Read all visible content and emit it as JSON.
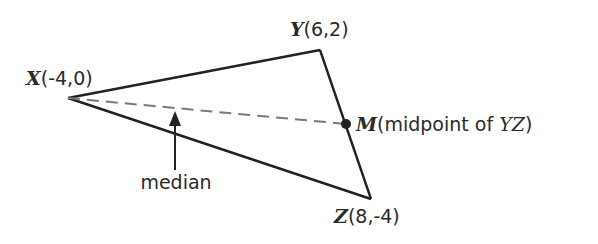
{
  "diagram": {
    "points": {
      "X": {
        "name": "X",
        "coords": "(-4,0)",
        "px": [
          68,
          98
        ]
      },
      "Y": {
        "name": "Y",
        "coords": "(6,2)",
        "px": [
          320,
          50
        ]
      },
      "Z": {
        "name": "Z",
        "coords": "(8,-4)",
        "px": [
          371,
          199
        ]
      },
      "M": {
        "name": "M",
        "desc_pre": "(midpoint of ",
        "desc_seg": "YZ",
        "desc_post": ")",
        "px": [
          346,
          124
        ]
      }
    },
    "median_label": "median",
    "colors": {
      "edge": "#222222",
      "median": "#7a7a7a",
      "text": "#2a2a2a"
    }
  }
}
